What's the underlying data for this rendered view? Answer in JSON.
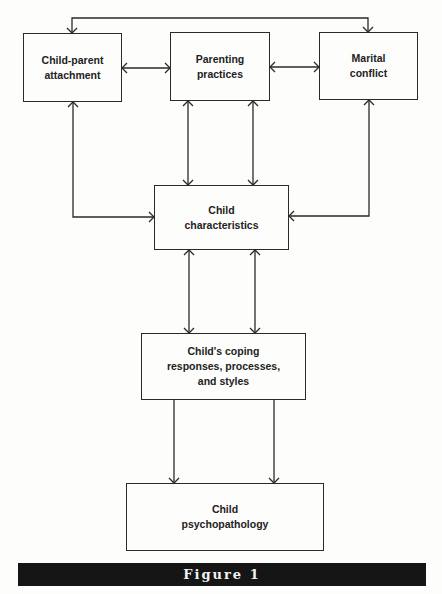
{
  "nodes": [
    {
      "id": "attachment",
      "label": "Child-parent\nattachment"
    },
    {
      "id": "parenting",
      "label": "Parenting\npractices"
    },
    {
      "id": "marital",
      "label": "Marital\nconflict"
    },
    {
      "id": "characteristics",
      "label": "Child\ncharacteristics"
    },
    {
      "id": "coping",
      "label": "Child's coping\nresponses, processes,\nand styles"
    },
    {
      "id": "psychopathology",
      "label": "Child\npsychopathology"
    }
  ],
  "edges": [
    {
      "from": "attachment",
      "to": "marital",
      "direction": "bidirectional"
    },
    {
      "from": "attachment",
      "to": "parenting",
      "direction": "bidirectional"
    },
    {
      "from": "parenting",
      "to": "marital",
      "direction": "bidirectional"
    },
    {
      "from": "attachment",
      "to": "characteristics",
      "direction": "bidirectional"
    },
    {
      "from": "parenting",
      "to": "characteristics",
      "direction": "bidirectional",
      "count": 2
    },
    {
      "from": "marital",
      "to": "characteristics",
      "direction": "bidirectional"
    },
    {
      "from": "characteristics",
      "to": "coping",
      "direction": "bidirectional",
      "count": 2
    },
    {
      "from": "coping",
      "to": "psychopathology",
      "direction": "forward",
      "count": 2
    }
  ],
  "caption": "Figure 1"
}
